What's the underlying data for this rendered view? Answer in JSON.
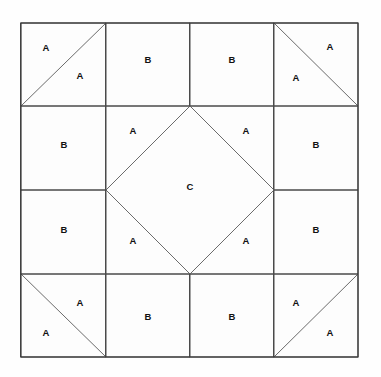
{
  "diagram": {
    "kind": "quilt-block-piecing-diagram",
    "canvas": {
      "width": 381,
      "height": 377
    },
    "block": {
      "left": 21,
      "top": 23,
      "right": 358,
      "bottom": 357,
      "grid_columns": 4,
      "grid_rows": 4,
      "cell_size": 84.25
    },
    "colors": {
      "background": "#ffffff",
      "piece_fill": "#fdfdfd",
      "line": "#4a4a4a",
      "outer_line": "#3a3a3a",
      "diagonal_line": "#5a5a5a",
      "label": "#111111"
    },
    "grid_lines": {
      "vertical_x": [
        21,
        106,
        190,
        274,
        358
      ],
      "horizontal_y": [
        23,
        106,
        190,
        274,
        357
      ]
    },
    "patch_legend": [
      {
        "code": "A",
        "description": "triangle patch"
      },
      {
        "code": "B",
        "description": "square patch"
      },
      {
        "code": "C",
        "description": "center diamond patch"
      }
    ],
    "labels": [
      {
        "id": "corner-tl-upper",
        "text": "A",
        "x": 46,
        "y": 48
      },
      {
        "id": "corner-tl-lower",
        "text": "A",
        "x": 80,
        "y": 76
      },
      {
        "id": "edge-top-left",
        "text": "B",
        "x": 148,
        "y": 60
      },
      {
        "id": "edge-top-right",
        "text": "B",
        "x": 232,
        "y": 60
      },
      {
        "id": "corner-tr-upper",
        "text": "A",
        "x": 330,
        "y": 47
      },
      {
        "id": "corner-tr-lower",
        "text": "A",
        "x": 296,
        "y": 78
      },
      {
        "id": "edge-left-upper",
        "text": "B",
        "x": 64,
        "y": 145
      },
      {
        "id": "center-tri-tl",
        "text": "A",
        "x": 133,
        "y": 131
      },
      {
        "id": "center-tri-tr",
        "text": "A",
        "x": 246,
        "y": 131
      },
      {
        "id": "edge-right-upper",
        "text": "B",
        "x": 316,
        "y": 145
      },
      {
        "id": "center-diamond",
        "text": "C",
        "x": 190,
        "y": 187
      },
      {
        "id": "edge-left-lower",
        "text": "B",
        "x": 64,
        "y": 230
      },
      {
        "id": "center-tri-bl",
        "text": "A",
        "x": 133,
        "y": 241
      },
      {
        "id": "center-tri-br",
        "text": "A",
        "x": 246,
        "y": 241
      },
      {
        "id": "edge-right-lower",
        "text": "B",
        "x": 316,
        "y": 230
      },
      {
        "id": "corner-bl-upper",
        "text": "A",
        "x": 80,
        "y": 303
      },
      {
        "id": "corner-bl-lower",
        "text": "A",
        "x": 46,
        "y": 333
      },
      {
        "id": "edge-bottom-left",
        "text": "B",
        "x": 148,
        "y": 317
      },
      {
        "id": "edge-bottom-right",
        "text": "B",
        "x": 232,
        "y": 317
      },
      {
        "id": "corner-br-upper",
        "text": "A",
        "x": 296,
        "y": 303
      },
      {
        "id": "corner-br-lower",
        "text": "A",
        "x": 330,
        "y": 333
      }
    ],
    "pieces": [
      {
        "id": "corner-tl",
        "type": "half-square-triangle",
        "diagonal": "bottom-left-to-top-right",
        "labels": [
          "A",
          "A"
        ]
      },
      {
        "id": "corner-tr",
        "type": "half-square-triangle",
        "diagonal": "top-left-to-bottom-right",
        "labels": [
          "A",
          "A"
        ]
      },
      {
        "id": "corner-bl",
        "type": "half-square-triangle",
        "diagonal": "top-left-to-bottom-right",
        "labels": [
          "A",
          "A"
        ]
      },
      {
        "id": "corner-br",
        "type": "half-square-triangle",
        "diagonal": "bottom-left-to-top-right",
        "labels": [
          "A",
          "A"
        ]
      },
      {
        "id": "edge-top-left",
        "type": "square",
        "labels": [
          "B"
        ]
      },
      {
        "id": "edge-top-right",
        "type": "square",
        "labels": [
          "B"
        ]
      },
      {
        "id": "edge-left-upper",
        "type": "square",
        "labels": [
          "B"
        ]
      },
      {
        "id": "edge-left-lower",
        "type": "square",
        "labels": [
          "B"
        ]
      },
      {
        "id": "edge-right-upper",
        "type": "square",
        "labels": [
          "B"
        ]
      },
      {
        "id": "edge-right-lower",
        "type": "square",
        "labels": [
          "B"
        ]
      },
      {
        "id": "edge-bottom-left",
        "type": "square",
        "labels": [
          "B"
        ]
      },
      {
        "id": "edge-bottom-right",
        "type": "square",
        "labels": [
          "B"
        ]
      },
      {
        "id": "center-diamond",
        "type": "on-point-square",
        "labels": [
          "C"
        ]
      },
      {
        "id": "center-corner-triangles",
        "type": "four-corner-triangles",
        "labels": [
          "A",
          "A",
          "A",
          "A"
        ]
      }
    ]
  }
}
